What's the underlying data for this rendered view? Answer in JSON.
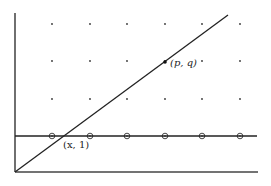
{
  "diagram": {
    "colors": {
      "stroke": "#222222",
      "background": "#ffffff",
      "dot": "#333333"
    },
    "axes": {
      "origin": [
        15,
        172
      ],
      "y_axis_top": [
        15,
        13
      ],
      "x_axis_right": [
        258,
        172
      ]
    },
    "horizontal_line": {
      "label": "y = 1",
      "y": 136,
      "x_start": 15,
      "x_end": 257
    },
    "diagonal_line": {
      "from": [
        15,
        172
      ],
      "to": [
        228,
        15
      ]
    },
    "grid": {
      "columns_x": [
        52,
        90,
        127,
        165,
        202,
        240
      ],
      "rows_y": [
        24,
        61,
        99
      ]
    },
    "circled_points": {
      "y": 136,
      "x": [
        52,
        90,
        127,
        165,
        202,
        240
      ]
    },
    "labels": {
      "pq": {
        "text": "(p, q)",
        "point": [
          165,
          62
        ],
        "text_pos": [
          170,
          66
        ]
      },
      "x1": {
        "text": "(x, 1)",
        "point": [
          64,
          136
        ],
        "text_pos": [
          63,
          148
        ]
      }
    }
  }
}
